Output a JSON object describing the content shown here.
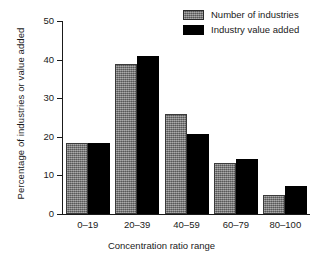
{
  "chart_data": {
    "type": "bar",
    "title": "",
    "xlabel": "Concentration ratio range",
    "ylabel": "Percentage of industries or value added",
    "categories": [
      "0–19",
      "20–39",
      "40–59",
      "60–79",
      "80–100"
    ],
    "series": [
      {
        "name": "Number of industries",
        "color": "#7d7d7d",
        "values": [
          18.4,
          38.8,
          26.0,
          13.2,
          4.9
        ]
      },
      {
        "name": "Industry value added",
        "color": "#000000",
        "values": [
          18.4,
          41.0,
          20.7,
          14.3,
          7.3
        ]
      }
    ],
    "ylim": [
      0,
      50
    ],
    "yticks": [
      0,
      10,
      20,
      30,
      40,
      50
    ],
    "ytick_labels": [
      "0",
      "10",
      "20",
      "30",
      "40",
      "50"
    ],
    "grid": false,
    "legend_position": "top-right"
  },
  "legend": {
    "items": [
      {
        "label": "Number of industries",
        "swatch": "gray-swatch-icon"
      },
      {
        "label": "Industry value added",
        "swatch": "black-swatch-icon"
      }
    ]
  },
  "axes": {
    "y_title": "Percentage of industries or value added",
    "x_title": "Concentration ratio range"
  }
}
